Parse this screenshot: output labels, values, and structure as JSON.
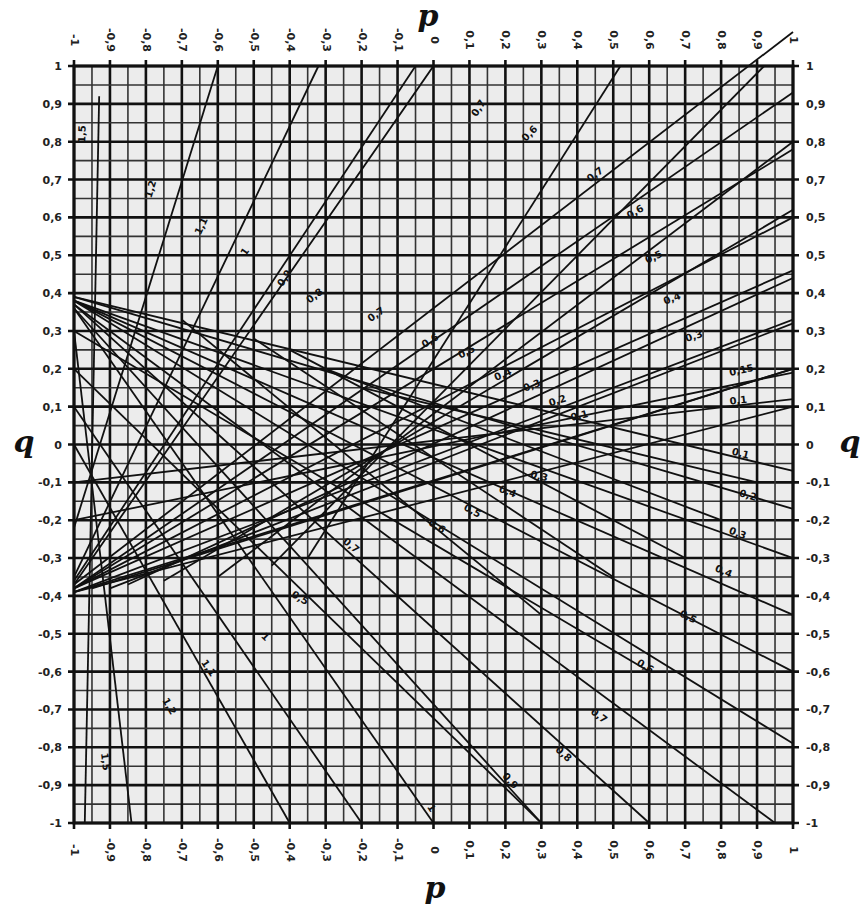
{
  "chart_data": {
    "type": "line",
    "title": "",
    "subtitle": "Nomogram (root lines over p–q grid)",
    "xlabel": "p",
    "ylabel": "q",
    "xlim": [
      -1,
      1
    ],
    "ylim": [
      -1,
      1
    ],
    "grid": true,
    "grid_major_step": 0.1,
    "grid_minor_step": 0.05,
    "legend": "none (lines labeled inline)",
    "x_ticks_top": [
      "-1",
      "-0,9",
      "-0,8",
      "-0,7",
      "-0,6",
      "-0,5",
      "-0,4",
      "-0,3",
      "-0,2",
      "-0,1",
      "0",
      "0,1",
      "0,2",
      "0,3",
      "0,4",
      "0,5",
      "0,6",
      "0,7",
      "0,8",
      "0,9",
      "1"
    ],
    "x_ticks_bottom": [
      "-1",
      "-0,9",
      "-0,8",
      "-0,7",
      "-0,6",
      "-0,5",
      "-0,4",
      "-0,3",
      "-0,2",
      "-0,1",
      "0",
      "0,1",
      "0,2",
      "0,3",
      "0,4",
      "0,5",
      "0,6",
      "0,7",
      "0,8",
      "0,9",
      "1"
    ],
    "y_ticks_left": [
      "1",
      "0,9",
      "0,8",
      "0,7",
      "0,6",
      "0,5",
      "0,4",
      "0,3",
      "0,2",
      "0,1",
      "0",
      "-0,1",
      "-0,2",
      "-0,3",
      "-0,4",
      "-0,5",
      "-0,6",
      "-0,7",
      "-0,8",
      "-0,9",
      "-1"
    ],
    "y_ticks_right": [
      "1",
      "0,9",
      "0,8",
      "0,7",
      "0,5",
      "0,5",
      "0,4",
      "0,3",
      "0,2",
      "0,1",
      "0",
      "-0,1",
      "-0,2",
      "-0,3",
      "-0,4",
      "-0,5",
      "-0,6",
      "-0,7",
      "-0,8",
      "-0,9",
      "-1"
    ],
    "series": [
      {
        "name": "1,5 (up)",
        "label": "1,5",
        "points": [
          [
            -0.97,
            -1.0
          ],
          [
            -0.93,
            0.92
          ]
        ],
        "label_at": [
          -0.96,
          0.82
        ]
      },
      {
        "name": "1,2 (up)",
        "label": "1,2",
        "points": [
          [
            -1.0,
            -0.22
          ],
          [
            -0.6,
            1.0
          ]
        ],
        "label_at": [
          -0.77,
          0.67
        ]
      },
      {
        "name": "1,1 (up)",
        "label": "1,1",
        "points": [
          [
            -1.0,
            -0.35
          ],
          [
            -0.32,
            1.0
          ]
        ],
        "label_at": [
          -0.63,
          0.57
        ]
      },
      {
        "name": "1 (up)",
        "label": "1",
        "points": [
          [
            -1.0,
            -0.36
          ],
          [
            -0.05,
            1.0
          ]
        ],
        "label_at": [
          -0.51,
          0.5
        ]
      },
      {
        "name": "0,9 (up)",
        "label": "0,9",
        "points": [
          [
            -1.0,
            -0.37
          ],
          [
            0.0,
            1.0
          ],
          [
            0.02,
            1.0
          ]
        ],
        "label_at": [
          -0.4,
          0.43
        ]
      },
      {
        "name": "0,8 (up)",
        "label": "0,8",
        "points": [
          [
            -1.0,
            -0.37
          ],
          [
            1.0,
            1.09
          ]
        ],
        "label_at": [
          -0.32,
          0.38
        ]
      },
      {
        "name": "0,7 (up)",
        "label": "0,7",
        "points": [
          [
            -1.0,
            -0.38
          ],
          [
            1.0,
            0.93
          ]
        ],
        "label_at": [
          -0.15,
          0.33
        ]
      },
      {
        "name": "0,6 (up)",
        "label": "0,6",
        "points": [
          [
            -1.0,
            -0.38
          ],
          [
            1.0,
            0.78
          ]
        ],
        "label_at": [
          0.0,
          0.26
        ]
      },
      {
        "name": "0,5 (up)",
        "label": "0,5",
        "points": [
          [
            -1.0,
            -0.38
          ],
          [
            1.0,
            0.6
          ]
        ],
        "label_at": [
          0.1,
          0.23
        ]
      },
      {
        "name": "0,4 (up)",
        "label": "0,4",
        "points": [
          [
            -1.0,
            -0.38
          ],
          [
            1.0,
            0.46
          ]
        ],
        "label_at": [
          0.2,
          0.17
        ]
      },
      {
        "name": "0,3 (up)",
        "label": "0,3",
        "points": [
          [
            -1.0,
            -0.39
          ],
          [
            1.0,
            0.33
          ]
        ],
        "label_at": [
          0.28,
          0.14
        ]
      },
      {
        "name": "0,2 (up)",
        "label": "0,2",
        "points": [
          [
            -1.0,
            -0.39
          ],
          [
            1.0,
            0.2
          ]
        ],
        "label_at": [
          0.35,
          0.1
        ]
      },
      {
        "name": "0,1 (up)",
        "label": "0,1",
        "points": [
          [
            -1.0,
            -0.39
          ],
          [
            1.0,
            0.1
          ]
        ],
        "label_at": [
          0.41,
          0.06
        ]
      },
      {
        "name": "0,7 (top)",
        "label": "0,7",
        "points": [
          [
            -0.35,
            -0.3
          ],
          [
            0.52,
            1.0
          ]
        ],
        "label_at": [
          0.14,
          0.88
        ]
      },
      {
        "name": "0,6 (top)",
        "label": "0,6",
        "points": [
          [
            -0.45,
            -0.32
          ],
          [
            0.92,
            1.0
          ]
        ],
        "label_at": [
          0.28,
          0.81
        ]
      },
      {
        "name": "0,5 (top)",
        "label": "0,7",
        "points": [
          [
            -0.6,
            -0.35
          ],
          [
            1.0,
            0.8
          ]
        ],
        "label_at": [
          0.46,
          0.7
        ]
      },
      {
        "name": "0,4 (top)",
        "label": "0,6",
        "points": [
          [
            -0.75,
            -0.36
          ],
          [
            1.0,
            0.62
          ]
        ],
        "label_at": [
          0.57,
          0.6
        ]
      },
      {
        "name": "0,3 (top)",
        "label": "0,5",
        "points": [
          [
            -0.85,
            -0.37
          ],
          [
            1.0,
            0.44
          ]
        ],
        "label_at": [
          0.62,
          0.48
        ]
      },
      {
        "name": "0,2 (top)",
        "label": "0,4",
        "points": [
          [
            -0.9,
            -0.38
          ],
          [
            1.0,
            0.32
          ]
        ],
        "label_at": [
          0.67,
          0.37
        ]
      },
      {
        "name": "0,1 (top)",
        "label": "0,3",
        "points": [
          [
            -0.95,
            -0.38
          ],
          [
            1.0,
            0.2
          ]
        ],
        "label_at": [
          0.73,
          0.27
        ]
      },
      {
        "name": "0,1 (right)",
        "label": "0,1",
        "points": [
          [
            -1.0,
            -0.1
          ],
          [
            1.0,
            0.12
          ]
        ],
        "label_at": [
          0.85,
          0.1
        ]
      },
      {
        "name": "0,15 (right)",
        "label": "0,15",
        "points": [
          [
            -1.0,
            -0.2
          ],
          [
            1.0,
            0.19
          ]
        ],
        "label_at": [
          0.86,
          0.18
        ]
      },
      {
        "name": "0,1 (down)",
        "label": "0,1",
        "points": [
          [
            -1.0,
            0.39
          ],
          [
            1.0,
            -0.07
          ]
        ],
        "label_at": [
          0.85,
          -0.04
        ]
      },
      {
        "name": "0,2 (down)",
        "label": "0,2",
        "points": [
          [
            -1.0,
            0.39
          ],
          [
            1.0,
            -0.17
          ]
        ],
        "label_at": [
          0.87,
          -0.15
        ]
      },
      {
        "name": "0,3 (down)",
        "label": "0,3",
        "points": [
          [
            -1.0,
            0.38
          ],
          [
            1.0,
            -0.3
          ]
        ],
        "label_at": [
          0.84,
          -0.25
        ]
      },
      {
        "name": "0,4 (down)",
        "label": "0,4",
        "points": [
          [
            -1.0,
            0.38
          ],
          [
            1.0,
            -0.45
          ]
        ],
        "label_at": [
          0.8,
          -0.35
        ]
      },
      {
        "name": "0,5 (down)",
        "label": "0,5",
        "points": [
          [
            -1.0,
            0.38
          ],
          [
            1.0,
            -0.6
          ]
        ],
        "label_at": [
          0.7,
          -0.47
        ]
      },
      {
        "name": "0,6 (down)",
        "label": "0,6",
        "points": [
          [
            -1.0,
            0.38
          ],
          [
            1.0,
            -0.79
          ]
        ],
        "label_at": [
          0.58,
          -0.6
        ]
      },
      {
        "name": "0,7 (down)",
        "label": "0,7",
        "points": [
          [
            -1.0,
            0.37
          ],
          [
            0.95,
            -1.0
          ]
        ],
        "label_at": [
          0.45,
          -0.73
        ]
      },
      {
        "name": "0,8 (down)",
        "label": "0,8",
        "points": [
          [
            -1.0,
            0.37
          ],
          [
            0.6,
            -1.0
          ]
        ],
        "label_at": [
          0.35,
          -0.83
        ]
      },
      {
        "name": "0,9 (down)",
        "label": "0,9",
        "points": [
          [
            -1.0,
            0.36
          ],
          [
            0.3,
            -1.0
          ]
        ],
        "label_at": [
          0.2,
          -0.9
        ]
      },
      {
        "name": "1 (down)",
        "label": "1",
        "points": [
          [
            -1.0,
            0.36
          ],
          [
            0.0,
            -1.0
          ]
        ],
        "label_at": [
          -0.02,
          -0.97
        ]
      },
      {
        "name": "0,7 (low)",
        "label": "0,7",
        "points": [
          [
            -0.7,
            0.33
          ],
          [
            0.3,
            -0.45
          ]
        ],
        "label_at": [
          -0.24,
          -0.28
        ]
      },
      {
        "name": "0,6 (low)",
        "label": "0,6",
        "points": [
          [
            -0.5,
            0.28
          ],
          [
            0.5,
            -0.35
          ]
        ],
        "label_at": [
          -0.0,
          -0.23
        ]
      },
      {
        "name": "0,5 (low)",
        "label": "0,5",
        "points": [
          [
            -0.4,
            0.25
          ],
          [
            0.7,
            -0.3
          ]
        ],
        "label_at": [
          0.1,
          -0.19
        ]
      },
      {
        "name": "0,4 (low)",
        "label": "0,4",
        "points": [
          [
            -0.3,
            0.2
          ],
          [
            0.8,
            -0.2
          ]
        ],
        "label_at": [
          0.2,
          -0.14
        ]
      },
      {
        "name": "0,3 (low)",
        "label": "0,3",
        "points": [
          [
            -0.2,
            0.15
          ],
          [
            0.9,
            -0.1
          ]
        ],
        "label_at": [
          0.29,
          -0.1
        ]
      },
      {
        "name": "0,5 (mid)",
        "label": "0,5",
        "points": [
          [
            -1.0,
            0.3
          ],
          [
            0.6,
            -0.6
          ]
        ],
        "label_at": [
          -0.38,
          -0.42
        ]
      },
      {
        "name": "1 (mid)",
        "label": "1",
        "points": [
          [
            -1.0,
            0.2
          ],
          [
            0.3,
            -1.0
          ]
        ],
        "label_at": [
          -0.48,
          -0.52
        ]
      },
      {
        "name": "1,1 (mid)",
        "label": "1,1",
        "points": [
          [
            -1.0,
            0.1
          ],
          [
            -0.2,
            -1.0
          ]
        ],
        "label_at": [
          -0.64,
          -0.6
        ]
      },
      {
        "name": "1,2 (mid)",
        "label": "1,2",
        "points": [
          [
            -1.0,
            0.0
          ],
          [
            -0.4,
            -1.0
          ]
        ],
        "label_at": [
          -0.75,
          -0.7
        ]
      },
      {
        "name": "1,5 (low)",
        "label": "1,5",
        "points": [
          [
            -1.0,
            0.3
          ],
          [
            -0.84,
            -1.0
          ]
        ],
        "label_at": [
          -0.93,
          -0.84
        ]
      }
    ]
  },
  "axes": {
    "p_label_top": "p",
    "p_label_bottom": "p",
    "q_label_left": "q",
    "q_label_right": "q"
  },
  "colors": {
    "background": "#ffffff",
    "plot_fill": "#ececec",
    "grid_major": "#111111",
    "grid_minor": "#333333",
    "line": "#111111"
  }
}
